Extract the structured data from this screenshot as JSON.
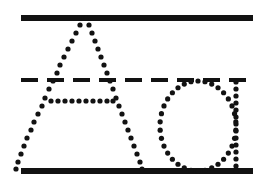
{
  "worksheet": {
    "title": "Handwriting Tracing Worksheet",
    "background_color": "#ffffff",
    "ink_color": "#121212",
    "width": 273,
    "height": 194,
    "guide_lines": [
      {
        "name": "top-line",
        "style": "solid",
        "y": 18,
        "x_start": 21,
        "x_end": 253,
        "thickness": 6
      },
      {
        "name": "middle-line",
        "style": "dashed",
        "y": 80,
        "x_start": 21,
        "x_end": 253,
        "thickness": 4,
        "dash_on": 17,
        "dash_off": 9
      },
      {
        "name": "bottom-line",
        "style": "solid",
        "y": 171,
        "x_start": 21,
        "x_end": 253,
        "thickness": 6
      }
    ],
    "letters": [
      {
        "name": "letter-a",
        "character": "A",
        "case": "uppercase",
        "style": "dotted-trace",
        "dot_radius": 2.6,
        "strokes": [
          {
            "name": "a-left-diagonal",
            "points": [
              [
                84,
                18
              ],
              [
                80,
                25
              ],
              [
                76,
                33
              ],
              [
                72,
                41
              ],
              [
                68,
                49
              ],
              [
                64,
                57
              ],
              [
                60,
                65
              ],
              [
                57,
                73
              ],
              [
                53,
                81
              ],
              [
                49,
                89
              ],
              [
                45,
                98
              ],
              [
                42,
                106
              ],
              [
                38,
                114
              ],
              [
                34,
                122
              ],
              [
                31,
                130
              ],
              [
                27,
                138
              ],
              [
                24,
                146
              ],
              [
                21,
                154
              ],
              [
                18,
                162
              ],
              [
                16,
                169
              ]
            ]
          },
          {
            "name": "a-right-diagonal",
            "points": [
              [
                86,
                18
              ],
              [
                89,
                25
              ],
              [
                92,
                33
              ],
              [
                95,
                41
              ],
              [
                98,
                49
              ],
              [
                101,
                57
              ],
              [
                104,
                65
              ],
              [
                107,
                73
              ],
              [
                110,
                81
              ],
              [
                113,
                89
              ],
              [
                116,
                98
              ],
              [
                119,
                106
              ],
              [
                122,
                114
              ],
              [
                125,
                122
              ],
              [
                128,
                130
              ],
              [
                131,
                138
              ],
              [
                134,
                146
              ],
              [
                137,
                154
              ],
              [
                140,
                162
              ],
              [
                142,
                169
              ]
            ]
          },
          {
            "name": "a-crossbar",
            "points": [
              [
                51,
                101
              ],
              [
                58,
                101
              ],
              [
                65,
                101
              ],
              [
                72,
                101
              ],
              [
                79,
                101
              ],
              [
                86,
                101
              ],
              [
                93,
                101
              ],
              [
                100,
                101
              ],
              [
                107,
                101
              ],
              [
                113,
                101
              ]
            ]
          }
        ]
      },
      {
        "name": "letter-o",
        "character": "O",
        "case": "lowercase",
        "style": "dotted-trace",
        "dot_radius": 2.6,
        "strokes": [
          {
            "name": "o-bowl",
            "shape": "ellipse",
            "cx": 198,
            "cy": 126,
            "rx": 38,
            "ry": 45,
            "dot_count": 34
          },
          {
            "name": "o-right-stem",
            "points": [
              [
                236,
                82
              ],
              [
                236,
                89
              ],
              [
                236,
                96
              ],
              [
                236,
                103
              ],
              [
                236,
                110
              ],
              [
                236,
                117
              ],
              [
                236,
                124
              ],
              [
                236,
                131
              ],
              [
                236,
                138
              ],
              [
                236,
                145
              ],
              [
                236,
                152
              ],
              [
                236,
                159
              ],
              [
                236,
                166
              ],
              [
                236,
                171
              ]
            ]
          }
        ]
      }
    ]
  }
}
